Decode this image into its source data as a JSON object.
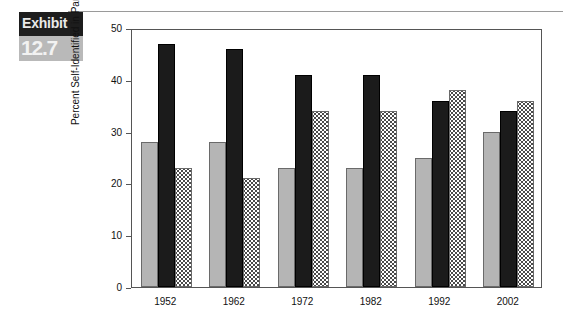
{
  "exhibit": {
    "word": "Exhibit",
    "number": "12.7"
  },
  "chart_data": {
    "type": "bar",
    "title": "",
    "subtitle": "",
    "xlabel": "",
    "ylabel": "Percent Self-Identified in Party",
    "categories": [
      "1952",
      "1962",
      "1972",
      "1982",
      "1992",
      "2002"
    ],
    "series": [
      {
        "name": "series-gray",
        "pattern": "solid-gray",
        "color": "#b5b5b5",
        "values": [
          28,
          28,
          23,
          23,
          25,
          30
        ]
      },
      {
        "name": "series-black",
        "pattern": "solid-black",
        "color": "#1b1b1b",
        "values": [
          47,
          46,
          41,
          41,
          36,
          34
        ]
      },
      {
        "name": "series-dotted",
        "pattern": "dotted",
        "color": "#ffffff",
        "values": [
          23,
          21,
          34,
          34,
          38,
          36
        ]
      }
    ],
    "ylim": [
      0,
      50
    ],
    "yticks": [
      0,
      10,
      20,
      30,
      40,
      50
    ],
    "ytick_labels": [
      "0",
      "10",
      "20",
      "30",
      "40",
      "50"
    ],
    "grid": false,
    "legend": "none",
    "legend_position": "none"
  }
}
